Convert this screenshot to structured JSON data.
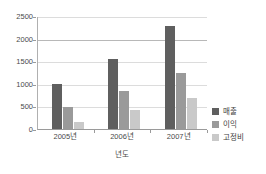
{
  "chart_data": {
    "type": "bar",
    "title": "",
    "subtitle": "",
    "xlabel": "년도",
    "ylabel": "",
    "categories": [
      "2005년",
      "2006년",
      "2007년"
    ],
    "series": [
      {
        "name": "매출",
        "values": [
          1000,
          1560,
          2270
        ],
        "color": "#5f5f5f"
      },
      {
        "name": "이익",
        "values": [
          490,
          850,
          1250
        ],
        "color": "#9a9a9a"
      },
      {
        "name": "고정비",
        "values": [
          160,
          430,
          690
        ],
        "color": "#c9c9c9"
      }
    ],
    "ylim": [
      0,
      2500
    ],
    "ytick_labels": [
      "2500",
      "2000",
      "1500",
      "1000",
      "500",
      "0"
    ],
    "ytick_values": [
      2500,
      2000,
      1500,
      1000,
      500,
      0
    ],
    "grid": true,
    "grid_axis": "y",
    "legend_position": "right",
    "orientation": "vertical",
    "grouping": "grouped"
  },
  "legend": {
    "items": [
      {
        "label": "매출",
        "swatch": "#5f5f5f"
      },
      {
        "label": "이익",
        "swatch": "#9a9a9a"
      },
      {
        "label": "고정비",
        "swatch": "#c9c9c9"
      }
    ]
  },
  "axes": {
    "x_title": "년도",
    "y_title": ""
  },
  "colors": {
    "background": "#ffffff",
    "gridline": "#dcdcdc",
    "gridline_major": "#b8b8b8",
    "axis": "#9a9a9a",
    "text": "#4a4a4a"
  }
}
